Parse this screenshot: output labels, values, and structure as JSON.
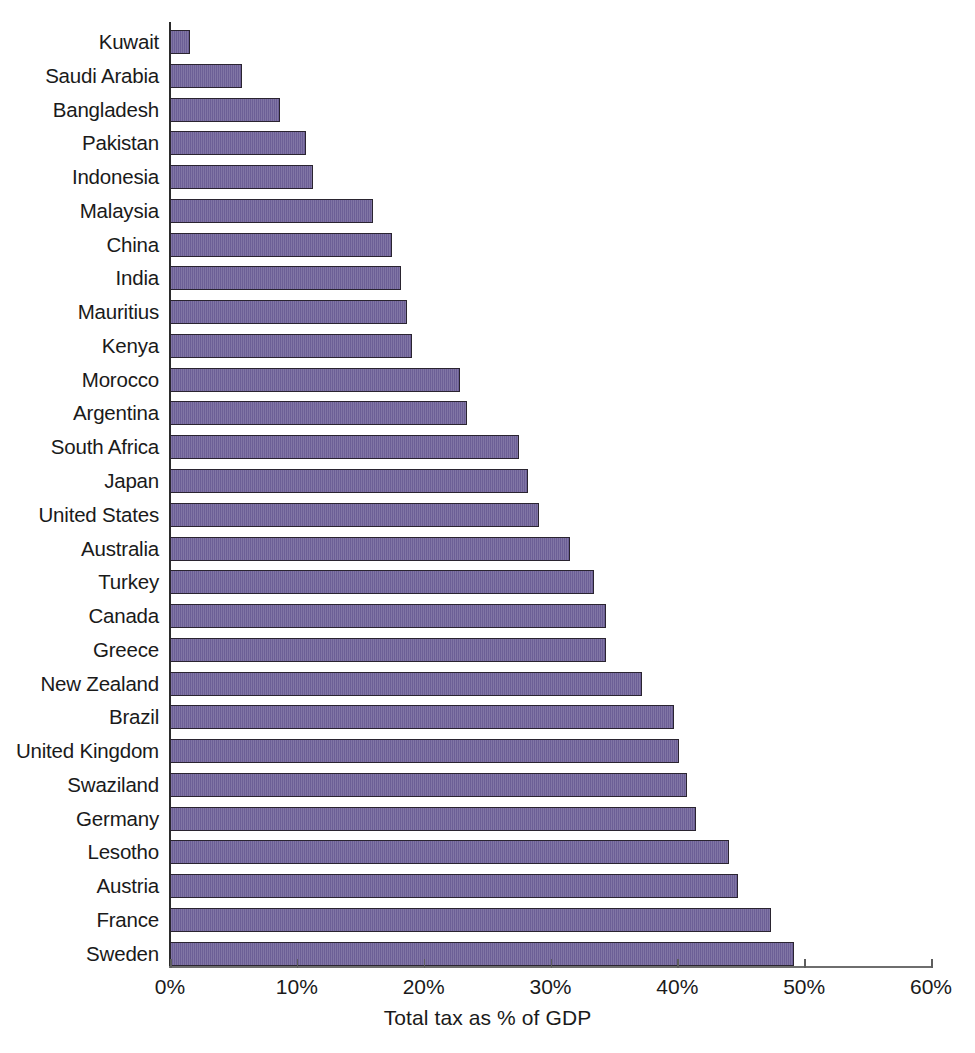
{
  "chart_data": {
    "type": "bar",
    "orientation": "horizontal",
    "title": "",
    "subtitle": "",
    "xlabel": "Total tax as % of GDP",
    "ylabel": "",
    "xlim": [
      0,
      60
    ],
    "ylim": null,
    "grid": false,
    "legend": null,
    "legend_position": "none",
    "unit": "%",
    "series_color": "#6c5f96",
    "bar_border_color": "#2a2430",
    "axis_color": "#2b2b2b",
    "x_ticks": [
      0,
      10,
      20,
      30,
      40,
      50,
      60
    ],
    "x_tick_labels": [
      "0%",
      "10%",
      "20%",
      "30%",
      "40%",
      "50%",
      "60%"
    ],
    "categories": [
      "Kuwait",
      "Saudi Arabia",
      "Bangladesh",
      "Pakistan",
      "Indonesia",
      "Malaysia",
      "China",
      "India",
      "Mauritius",
      "Kenya",
      "Morocco",
      "Argentina",
      "South Africa",
      "Japan",
      "United States",
      "Australia",
      "Turkey",
      "Canada",
      "Greece",
      "New Zealand",
      "Brazil",
      "United Kingdom",
      "Swaziland",
      "Germany",
      "Lesotho",
      "Austria",
      "France",
      "Sweden"
    ],
    "values": [
      1.6,
      5.7,
      8.7,
      10.7,
      11.3,
      16.0,
      17.5,
      18.2,
      18.7,
      19.1,
      22.9,
      23.4,
      27.5,
      28.2,
      29.1,
      31.5,
      33.4,
      34.4,
      34.4,
      37.2,
      39.7,
      40.1,
      40.8,
      41.5,
      44.1,
      44.8,
      47.4,
      49.2
    ]
  }
}
